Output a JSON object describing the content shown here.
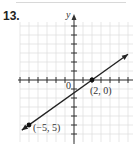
{
  "problem_number": "13.",
  "chart_data": {
    "type": "line",
    "title": "",
    "xlabel": "",
    "ylabel": "y",
    "origin_label": "0",
    "xlim": [
      -6,
      6
    ],
    "ylim": [
      -6,
      6
    ],
    "grid": true,
    "series": [
      {
        "name": "line",
        "x": [
          -5,
          2
        ],
        "y": [
          -5,
          0
        ],
        "arrows": "both",
        "color": "#222222"
      }
    ],
    "points": [
      {
        "x": 2,
        "y": 0,
        "label": "(2, 0)"
      },
      {
        "x": -5,
        "y": -5,
        "label": "(−5, 5)"
      }
    ]
  }
}
